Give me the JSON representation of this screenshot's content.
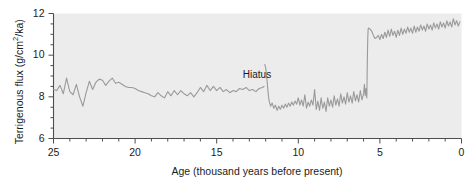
{
  "chart_data": {
    "type": "line",
    "title": "",
    "xlabel": "Age (thousand years before present)",
    "ylabel_prefix": "Terrigenous flux (g/cm",
    "ylabel_sup": "2",
    "ylabel_suffix": "/ka)",
    "ylabel": "Terrigenous flux (g/cm2/ka)",
    "xlim": [
      25,
      0
    ],
    "ylim": [
      6,
      12
    ],
    "x_reversed": true,
    "grid": false,
    "legend": null,
    "xticks_major": [
      25,
      20,
      15,
      10,
      5,
      0
    ],
    "xticks_major_labels": [
      "25",
      "20",
      "15",
      "10",
      "5",
      "0"
    ],
    "xtick_minor_step": 1,
    "yticks_major": [
      6,
      8,
      10,
      12
    ],
    "yticks_major_labels": [
      "6",
      "8",
      "10",
      "12"
    ],
    "ytick_minor_step": 0.5,
    "line_color": "#9a9a9a",
    "plot_bg_color": "#ececed",
    "axis_color": "#4d4d4d",
    "text_color": "#1c1c1c",
    "annotations": [
      {
        "text": "Hiatus",
        "x": 13.4,
        "y": 9.0
      }
    ],
    "series": [
      {
        "name": "Terrigenous flux",
        "segments": [
          {
            "name": "pre-hiatus",
            "x": [
              25.0,
              24.8,
              24.6,
              24.4,
              24.2,
              24.0,
              23.8,
              23.6,
              23.4,
              23.2,
              23.0,
              22.8,
              22.6,
              22.4,
              22.2,
              22.0,
              21.8,
              21.6,
              21.4,
              21.2,
              21.0,
              20.8,
              20.6,
              20.4,
              20.2,
              20.0,
              19.8,
              19.6,
              19.4,
              19.2,
              19.0,
              18.8,
              18.6,
              18.4,
              18.2,
              18.0,
              17.8,
              17.6,
              17.4,
              17.2,
              17.0,
              16.8,
              16.6,
              16.4,
              16.2,
              16.0,
              15.8,
              15.6,
              15.4,
              15.2,
              15.0,
              14.8,
              14.6,
              14.4,
              14.2,
              14.0,
              13.8,
              13.6,
              13.4,
              13.2,
              13.0,
              12.8,
              12.6,
              12.4,
              12.2,
              12.1
            ],
            "y": [
              8.35,
              8.3,
              8.55,
              8.15,
              8.9,
              8.25,
              8.1,
              8.6,
              8.0,
              7.55,
              8.2,
              8.75,
              8.35,
              8.7,
              8.85,
              8.8,
              8.55,
              8.75,
              8.9,
              8.65,
              8.7,
              8.6,
              8.5,
              8.45,
              8.45,
              8.4,
              8.3,
              8.25,
              8.2,
              8.15,
              8.05,
              8.0,
              8.2,
              8.05,
              7.95,
              8.25,
              8.05,
              8.3,
              8.1,
              8.3,
              8.15,
              8.05,
              8.2,
              8.0,
              8.2,
              8.45,
              8.25,
              8.55,
              8.3,
              8.5,
              8.3,
              8.45,
              8.25,
              8.35,
              8.2,
              8.3,
              8.25,
              8.4,
              8.35,
              8.45,
              8.3,
              8.35,
              8.25,
              8.4,
              8.45,
              8.5
            ]
          },
          {
            "name": "post-hiatus",
            "x": [
              12.05,
              12.0,
              11.95,
              11.9,
              11.85,
              11.8,
              11.7,
              11.6,
              11.5,
              11.4,
              11.3,
              11.2,
              11.1,
              11.0,
              10.9,
              10.8,
              10.7,
              10.6,
              10.5,
              10.4,
              10.3,
              10.2,
              10.1,
              10.0,
              9.9,
              9.8,
              9.7,
              9.6,
              9.5,
              9.4,
              9.3,
              9.2,
              9.1,
              9.0,
              8.9,
              8.8,
              8.7,
              8.6,
              8.5,
              8.4,
              8.3,
              8.2,
              8.1,
              8.0,
              7.9,
              7.8,
              7.7,
              7.6,
              7.5,
              7.4,
              7.3,
              7.2,
              7.1,
              7.0,
              6.9,
              6.8,
              6.7,
              6.6,
              6.5,
              6.4,
              6.3,
              6.2,
              6.1,
              6.0,
              5.95,
              5.9,
              5.85,
              5.8,
              5.78,
              5.76,
              5.74,
              5.72,
              5.7,
              5.6,
              5.5,
              5.4,
              5.3,
              5.2,
              5.1,
              5.0,
              4.9,
              4.8,
              4.7,
              4.6,
              4.5,
              4.4,
              4.3,
              4.2,
              4.1,
              4.0,
              3.9,
              3.8,
              3.7,
              3.6,
              3.5,
              3.4,
              3.3,
              3.2,
              3.1,
              3.0,
              2.9,
              2.8,
              2.7,
              2.6,
              2.5,
              2.4,
              2.3,
              2.2,
              2.1,
              2.0,
              1.9,
              1.8,
              1.7,
              1.6,
              1.5,
              1.4,
              1.3,
              1.2,
              1.1,
              1.0,
              0.9,
              0.8,
              0.7,
              0.6,
              0.5,
              0.4,
              0.3,
              0.2,
              0.1,
              0.0
            ],
            "y": [
              9.55,
              9.4,
              9.05,
              8.65,
              8.2,
              7.85,
              7.55,
              7.7,
              7.45,
              7.6,
              7.35,
              7.55,
              7.4,
              7.6,
              7.45,
              7.65,
              7.5,
              7.7,
              7.55,
              7.75,
              7.6,
              7.8,
              7.65,
              7.95,
              7.6,
              7.85,
              7.55,
              8.1,
              7.45,
              7.75,
              7.55,
              7.85,
              7.6,
              8.35,
              7.4,
              7.8,
              7.35,
              7.95,
              7.45,
              7.75,
              7.3,
              7.95,
              7.55,
              7.85,
              7.5,
              8.05,
              7.6,
              7.9,
              7.55,
              8.15,
              7.7,
              8.0,
              7.65,
              8.2,
              7.75,
              8.05,
              7.7,
              8.25,
              7.8,
              8.1,
              7.75,
              8.3,
              7.85,
              8.15,
              8.6,
              8.05,
              8.4,
              7.95,
              9.2,
              10.2,
              10.9,
              11.25,
              11.3,
              11.25,
              11.15,
              10.95,
              10.8,
              10.85,
              10.95,
              10.75,
              11.0,
              10.8,
              11.1,
              10.85,
              11.2,
              10.9,
              11.25,
              10.95,
              11.15,
              10.85,
              11.2,
              10.95,
              11.3,
              11.0,
              11.25,
              11.05,
              11.35,
              11.1,
              11.3,
              11.05,
              11.4,
              11.1,
              11.35,
              11.15,
              11.45,
              11.2,
              11.4,
              11.15,
              11.5,
              11.25,
              11.45,
              11.2,
              11.55,
              11.3,
              11.5,
              11.25,
              11.6,
              11.35,
              11.55,
              11.3,
              11.65,
              11.4,
              11.6,
              11.35,
              11.75,
              11.45,
              11.65,
              11.4,
              11.6
            ]
          }
        ]
      }
    ]
  }
}
